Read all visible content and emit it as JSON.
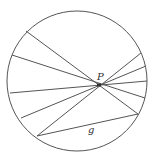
{
  "diagram": {
    "title": "",
    "circle": {
      "cx": 77,
      "cy": 81,
      "r": 70
    },
    "point_P": {
      "x": 99,
      "y": 85,
      "label": "P"
    },
    "chord_label": {
      "text": "g",
      "x": 88,
      "y": 133
    },
    "stroke_color": "#555555",
    "chords_through_P": [
      {
        "left": [
          26,
          31
        ],
        "right": [
          138,
          114
        ]
      },
      {
        "left": [
          12,
          55
        ],
        "right": [
          145,
          98
        ]
      },
      {
        "left": [
          10,
          93
        ],
        "right": [
          147,
          81
        ]
      },
      {
        "left": [
          21,
          118
        ],
        "right": [
          146,
          66
        ]
      },
      {
        "left": [
          37,
          136
        ],
        "right": [
          141,
          53
        ]
      }
    ],
    "chord_g": {
      "from": [
        37,
        136
      ],
      "to": [
        138,
        114
      ],
      "label": "g"
    }
  }
}
